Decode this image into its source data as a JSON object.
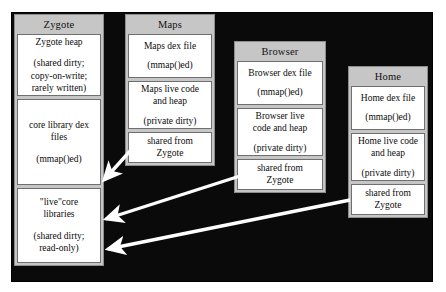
{
  "figure": {
    "background_color": "#0a0a0a",
    "frame_color": "#c6c6c6",
    "cell_color": "#ffffff",
    "arrow_color": "#ffffff"
  },
  "columns": [
    {
      "id": "zygote",
      "title": "Zygote",
      "cells": [
        {
          "line1": "Zygote heap",
          "line2": "(shared dirty;",
          "line3": "copy-on-write;",
          "line4": "rarely written)"
        },
        {
          "line1": "core library dex",
          "line2": "files",
          "line3": "(mmap()ed)"
        },
        {
          "line1": "\"live\"core",
          "line2": "libraries",
          "line3": "(shared dirty;",
          "line4": "read-only)"
        }
      ]
    },
    {
      "id": "maps",
      "title": "Maps",
      "cells": [
        {
          "line1": "Maps dex file",
          "line2": "(mmap()ed)"
        },
        {
          "line1": "Maps live code",
          "line2": "and heap",
          "line3": "(private dirty)"
        },
        {
          "line1": "shared from",
          "line2": "Zygote"
        }
      ]
    },
    {
      "id": "browser",
      "title": "Browser",
      "cells": [
        {
          "line1": "Browser dex file",
          "line2": "(mmap()ed)"
        },
        {
          "line1": "Browser live",
          "line2": "code and heap",
          "line3": "(private dirty)"
        },
        {
          "line1": "shared from",
          "line2": "Zygote"
        }
      ]
    },
    {
      "id": "home",
      "title": "Home",
      "cells": [
        {
          "line1": "Home dex file",
          "line2": "(mmap()ed)"
        },
        {
          "line1": "Home live code",
          "line2": "and heap",
          "line3": "(private dirty)"
        },
        {
          "line1": "shared from",
          "line2": "Zygote"
        }
      ]
    }
  ],
  "arrows": [
    {
      "from": "maps-shared-cell",
      "to": "zygote-live-core-libraries",
      "x1": 131,
      "y1": 150,
      "x2": 104,
      "y2": 180
    },
    {
      "from": "browser-shared-cell",
      "to": "zygote-live-core-libraries",
      "x1": 240,
      "y1": 176,
      "x2": 106,
      "y2": 219
    },
    {
      "from": "home-shared-cell",
      "to": "zygote-live-core-libraries",
      "x1": 350,
      "y1": 200,
      "x2": 108,
      "y2": 249
    }
  ]
}
